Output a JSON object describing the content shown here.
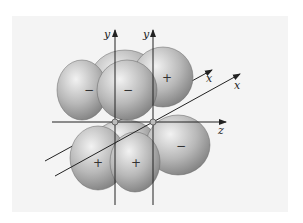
{
  "diagram": {
    "type": "p-orbital overlap (two adjacent p orbitals on parallel y axes)",
    "axes": {
      "left_y": "y",
      "right_y": "y",
      "front_x": "x",
      "back_x": "x",
      "z": "z"
    },
    "lobes": [
      {
        "id": "upper-left-back",
        "sign": "−"
      },
      {
        "id": "upper-middle-front",
        "sign": "−"
      },
      {
        "id": "upper-right",
        "sign": "+"
      },
      {
        "id": "lower-left",
        "sign": "+"
      },
      {
        "id": "lower-middle-front",
        "sign": "+"
      },
      {
        "id": "lower-right",
        "sign": "−"
      }
    ],
    "colors": {
      "lobe_light": "#e6e6e6",
      "lobe_dark": "#8a8a8a",
      "axis": "#222222",
      "background": "#f4f4f4"
    }
  }
}
